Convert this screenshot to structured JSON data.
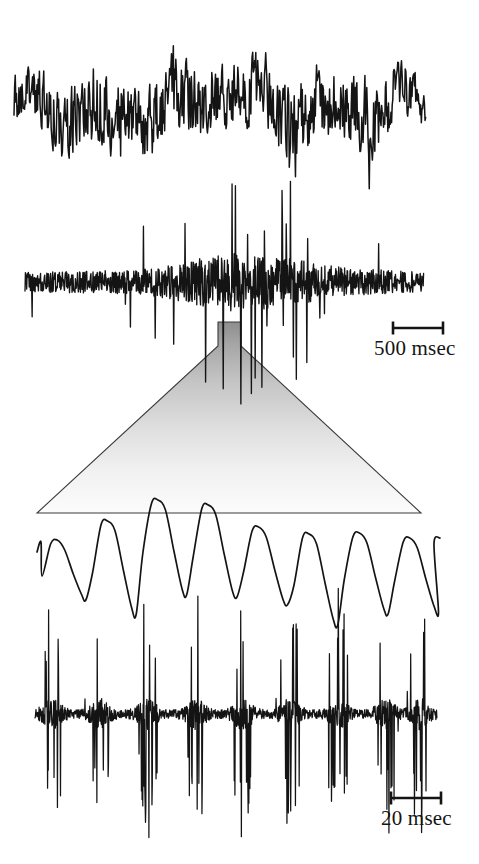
{
  "figure": {
    "type": "electrophysiology-recording",
    "background_color": "#ffffff",
    "trace_color": "#141414",
    "funnel_color_top": "#9a9a9a",
    "funnel_color_bottom": "#fbfbfb"
  },
  "scalebars": {
    "top": {
      "label": "500 msec",
      "x": 393,
      "y": 328,
      "length": 50,
      "cap_height": 13
    },
    "bottom": {
      "label": "20 msec",
      "x": 391,
      "y": 798,
      "length": 50,
      "cap_height": 13
    }
  },
  "panels": [
    {
      "name": "top-field-potential-trace",
      "kind": "field-potential",
      "x0": 14,
      "x1": 426,
      "baseline": 105,
      "seed": 1731,
      "description": "Continuous high-frequency field potential with a dense high-amplitude burst in the middle-right portion"
    },
    {
      "name": "top-unit-trace",
      "kind": "multi-unit",
      "x0": 25,
      "x1": 424,
      "baseline": 282,
      "seed": 907,
      "description": "Multi-unit spike recording: low baseline noise at left and right, large-amplitude spike burst in the centre"
    },
    {
      "name": "expanded-oscillation-trace",
      "kind": "oscillation",
      "x0": 37,
      "x1": 440,
      "baseline": 562,
      "seed": 554,
      "description": "Time-expanded rhythmic oscillation showing roughly eight cycles"
    },
    {
      "name": "expanded-unit-trace",
      "kind": "multi-unit-expanded",
      "x0": 35,
      "x1": 437,
      "baseline": 714,
      "seed": 2280,
      "description": "Time-expanded multi-unit spike recording with bursts phase-locked to each oscillation cycle"
    }
  ],
  "funnel": {
    "name": "expansion-funnel",
    "apex_left": 218,
    "apex_right": 241,
    "apex_top": 322,
    "neck_bottom": 346,
    "base_left": 37,
    "base_right": 421,
    "base_bottom": 513
  },
  "chart_data": {
    "type": "line",
    "title": "",
    "xlabel": "",
    "ylabel": "",
    "grid": false,
    "legend_position": "none",
    "panels": [
      {
        "name": "top-field-potential-trace",
        "description": "Field potential, slow time base",
        "time_scale": "500 msec",
        "envelope_profile": [
          {
            "x_frac": 0.0,
            "amplitude": 0.55
          },
          {
            "x_frac": 0.08,
            "amplitude": 0.7
          },
          {
            "x_frac": 0.18,
            "amplitude": 0.95
          },
          {
            "x_frac": 0.28,
            "amplitude": 0.82
          },
          {
            "x_frac": 0.38,
            "amplitude": 1.0
          },
          {
            "x_frac": 0.48,
            "amplitude": 0.72
          },
          {
            "x_frac": 0.58,
            "amplitude": 0.8
          },
          {
            "x_frac": 0.7,
            "amplitude": 0.95
          },
          {
            "x_frac": 0.82,
            "amplitude": 0.88
          },
          {
            "x_frac": 0.92,
            "amplitude": 0.7
          },
          {
            "x_frac": 1.0,
            "amplitude": 0.55
          }
        ],
        "peak_amplitude_px": 62,
        "dominant_character": "broadband irregular"
      },
      {
        "name": "top-unit-trace",
        "description": "Multi-unit activity, slow time base",
        "time_scale": "500 msec",
        "envelope_profile": [
          {
            "x_frac": 0.0,
            "amplitude": 0.1
          },
          {
            "x_frac": 0.1,
            "amplitude": 0.12
          },
          {
            "x_frac": 0.2,
            "amplitude": 0.16
          },
          {
            "x_frac": 0.3,
            "amplitude": 0.22
          },
          {
            "x_frac": 0.4,
            "amplitude": 0.6
          },
          {
            "x_frac": 0.5,
            "amplitude": 1.0
          },
          {
            "x_frac": 0.6,
            "amplitude": 0.95
          },
          {
            "x_frac": 0.7,
            "amplitude": 0.62
          },
          {
            "x_frac": 0.8,
            "amplitude": 0.3
          },
          {
            "x_frac": 0.9,
            "amplitude": 0.18
          },
          {
            "x_frac": 1.0,
            "amplitude": 0.1
          }
        ],
        "peak_amplitude_px": 58,
        "dominant_character": "sparse spikes on noise, dense central burst"
      },
      {
        "name": "expanded-oscillation-trace",
        "description": "Expanded oscillation, fast time base",
        "time_scale": "20 msec",
        "cycle_count": 8,
        "peaks_y_px": [
          540,
          521,
          500,
          505,
          527,
          534,
          533,
          538,
          530
        ],
        "troughs_y_px": [
          600,
          614,
          595,
          597,
          605,
          625,
          614,
          612
        ],
        "peak_amplitude_px": 40,
        "dominant_character": "rhythmic sinusoid-like with sharp troughs"
      },
      {
        "name": "expanded-unit-trace",
        "description": "Expanded multi-unit activity, fast time base",
        "time_scale": "20 msec",
        "burst_count": 8,
        "burst_x_px": [
          52,
          100,
          148,
          196,
          243,
          290,
          338,
          386,
          420
        ],
        "peak_amplitude_px": 58,
        "dominant_character": "phase-locked spike bursts on noisy baseline"
      }
    ]
  }
}
